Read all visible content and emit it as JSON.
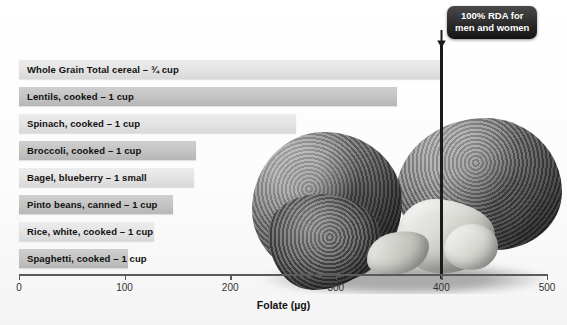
{
  "chart_data": {
    "type": "bar",
    "orientation": "horizontal",
    "title": "",
    "xlabel": "Folate (µg)",
    "ylabel": "",
    "xlim": [
      0,
      500
    ],
    "xticks": [
      0,
      100,
      200,
      300,
      400,
      500
    ],
    "grid": false,
    "legend": "none",
    "categories": [
      "Whole Grain Total cereal – ¾ cup",
      "Lentils, cooked – 1 cup",
      "Spinach, cooked – 1 cup",
      "Broccoli, cooked – 1 cup",
      "Bagel, blueberry – 1 small",
      "Pinto beans, canned – 1 cup",
      "Rice, white, cooked – 1 cup",
      "Spaghetti, cooked – 1 cup"
    ],
    "values": [
      400,
      358,
      262,
      168,
      166,
      146,
      128,
      103
    ],
    "bar_shades": [
      "light",
      "dark",
      "light",
      "dark",
      "light",
      "dark",
      "light",
      "dark"
    ],
    "annotations": [
      {
        "name": "rda-reference-line",
        "text": "100% RDA for men and women",
        "line1": "100% RDA for",
        "line2": "men and women",
        "x_value": 400
      }
    ],
    "colors": {
      "bar_light": "#e3e3e3",
      "bar_dark": "#c3c3c3",
      "rda_line": "#1b1b1b",
      "callout_background": "#2b2b2b",
      "callout_text": "#ffffff",
      "axis": "#5a5a5a",
      "background": "#fdfdfd"
    }
  },
  "figure": {
    "photo_caption": "",
    "photo_subjects": [
      "broccoli-floret",
      "cauliflower-floret"
    ]
  },
  "icons": {
    "callout_arrow": "down-arrow-icon"
  }
}
